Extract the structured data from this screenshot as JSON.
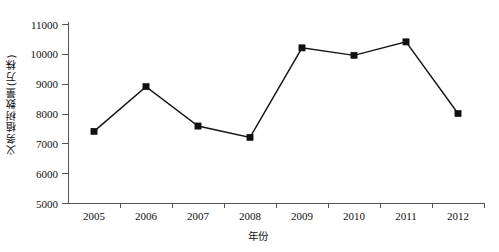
{
  "chart_data": {
    "type": "line",
    "title": "",
    "xlabel": "年份",
    "ylabel": "义务植树数量(万株)",
    "categories": [
      "2005",
      "2006",
      "2007",
      "2008",
      "2009",
      "2010",
      "2011",
      "2012"
    ],
    "values": [
      7400,
      8900,
      7580,
      7200,
      10200,
      9950,
      10400,
      8000
    ],
    "series": [
      {
        "name": "义务植树数量(万株)",
        "values": [
          7400,
          8900,
          7580,
          7200,
          10200,
          9950,
          10400,
          8000
        ]
      }
    ],
    "ylim": [
      5000,
      11000
    ],
    "ytick_labels": [
      "5000",
      "6000",
      "7000",
      "8000",
      "9000",
      "10000",
      "11000"
    ],
    "ytick_values": [
      5000,
      6000,
      7000,
      8000,
      9000,
      10000,
      11000
    ],
    "xtick_labels": [
      "2005",
      "2006",
      "2007",
      "2008",
      "2009",
      "2010",
      "2011",
      "2012"
    ],
    "grid": false,
    "legend": "none",
    "marker": "square",
    "line_color": "#141414",
    "marker_color": "#111111",
    "axis_color": "#555555"
  }
}
